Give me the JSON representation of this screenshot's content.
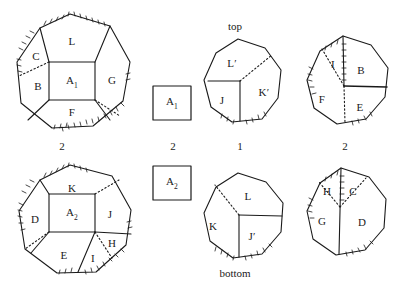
{
  "figure": {
    "title_top": "top",
    "title_bottom": "bottom"
  },
  "shapes": [
    {
      "id": "octagon-top-left",
      "number": "2",
      "faces": [
        "L",
        "C",
        "B",
        "A",
        "G",
        "F"
      ],
      "center_label": "A",
      "center_sub": "1",
      "labels": [
        {
          "text": "L",
          "x": 72,
          "y": 41
        },
        {
          "text": "C",
          "x": 36,
          "y": 56
        },
        {
          "text": "B",
          "x": 38,
          "y": 86
        },
        {
          "text": "G",
          "x": 112,
          "y": 80
        },
        {
          "text": "F",
          "x": 72,
          "y": 112
        }
      ]
    },
    {
      "id": "octagon-top-middle",
      "number": "1",
      "caption": "top",
      "labels": [
        {
          "text": "L′",
          "x": 232,
          "y": 63
        },
        {
          "text": "J",
          "x": 222,
          "y": 100
        },
        {
          "text": "K′",
          "x": 264,
          "y": 92
        }
      ]
    },
    {
      "id": "octagon-top-right",
      "number": "2",
      "labels": [
        {
          "text": "I",
          "x": 333,
          "y": 64
        },
        {
          "text": "B",
          "x": 361,
          "y": 70
        },
        {
          "text": "F",
          "x": 322,
          "y": 99
        },
        {
          "text": "E",
          "x": 360,
          "y": 107
        }
      ]
    },
    {
      "id": "octagon-bottom-left",
      "faces": [
        "K",
        "D",
        "A",
        "J",
        "E",
        "I",
        "H"
      ],
      "center_label": "A",
      "center_sub": "2",
      "labels": [
        {
          "text": "K",
          "x": 72,
          "y": 188
        },
        {
          "text": "D",
          "x": 35,
          "y": 219
        },
        {
          "text": "J",
          "x": 110,
          "y": 214
        },
        {
          "text": "H",
          "x": 112,
          "y": 243
        },
        {
          "text": "E",
          "x": 64,
          "y": 255
        },
        {
          "text": "I",
          "x": 93,
          "y": 258
        }
      ]
    },
    {
      "id": "octagon-bottom-middle",
      "caption": "bottom",
      "labels": [
        {
          "text": "L",
          "x": 248,
          "y": 196
        },
        {
          "text": "K",
          "x": 213,
          "y": 226
        },
        {
          "text": "J′",
          "x": 252,
          "y": 236
        }
      ]
    },
    {
      "id": "octagon-bottom-right",
      "labels": [
        {
          "text": "H",
          "x": 327,
          "y": 191
        },
        {
          "text": "C",
          "x": 353,
          "y": 191
        },
        {
          "text": "G",
          "x": 322,
          "y": 221
        },
        {
          "text": "D",
          "x": 362,
          "y": 222
        }
      ]
    }
  ],
  "boxes": [
    {
      "id": "square-a1",
      "label": "A",
      "sub": "1",
      "number": "2",
      "x": 173,
      "y": 104
    },
    {
      "id": "square-a2",
      "label": "A",
      "sub": "2",
      "number": "",
      "x": 173,
      "y": 184
    }
  ],
  "numbers": [
    {
      "id": "num-top-left",
      "text": "2",
      "x": 62,
      "y": 146
    },
    {
      "id": "num-square-a1",
      "text": "2",
      "x": 173,
      "y": 146
    },
    {
      "id": "num-top-middle",
      "text": "1",
      "x": 240,
      "y": 146
    },
    {
      "id": "num-top-right",
      "text": "2",
      "x": 345,
      "y": 146
    }
  ],
  "colors": {
    "stroke": "#1a1a1a",
    "background": "#ffffff",
    "text": "#1a1a1a"
  }
}
